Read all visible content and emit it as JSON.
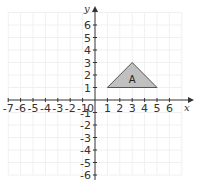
{
  "chart_data": {
    "type": "scatter",
    "title": "",
    "xlabel": "x",
    "ylabel": "y",
    "xlim": [
      -7,
      7
    ],
    "ylim": [
      -6,
      7
    ],
    "grid": true,
    "x_ticks": [
      "-7",
      "-6",
      "-5",
      "-4",
      "-3",
      "-2",
      "-1",
      "1",
      "2",
      "3",
      "4",
      "5",
      "6"
    ],
    "y_ticks": [
      "6",
      "5",
      "4",
      "3",
      "2",
      "1",
      "-1",
      "-2",
      "-3",
      "-4",
      "-5",
      "-6"
    ],
    "origin_label": "0",
    "shapes": [
      {
        "name": "A",
        "kind": "triangle",
        "vertices": [
          [
            1,
            1
          ],
          [
            3,
            3
          ],
          [
            5,
            1
          ]
        ],
        "fill": "#c0c0c0",
        "stroke": "#555555"
      }
    ]
  },
  "axes": {
    "x_label": "x",
    "y_label": "y",
    "origin": "0"
  },
  "colors": {
    "axis": "#333333",
    "grid": "#f0f0f0",
    "shape_fill": "#c0c0c0",
    "shape_stroke": "#555555"
  }
}
